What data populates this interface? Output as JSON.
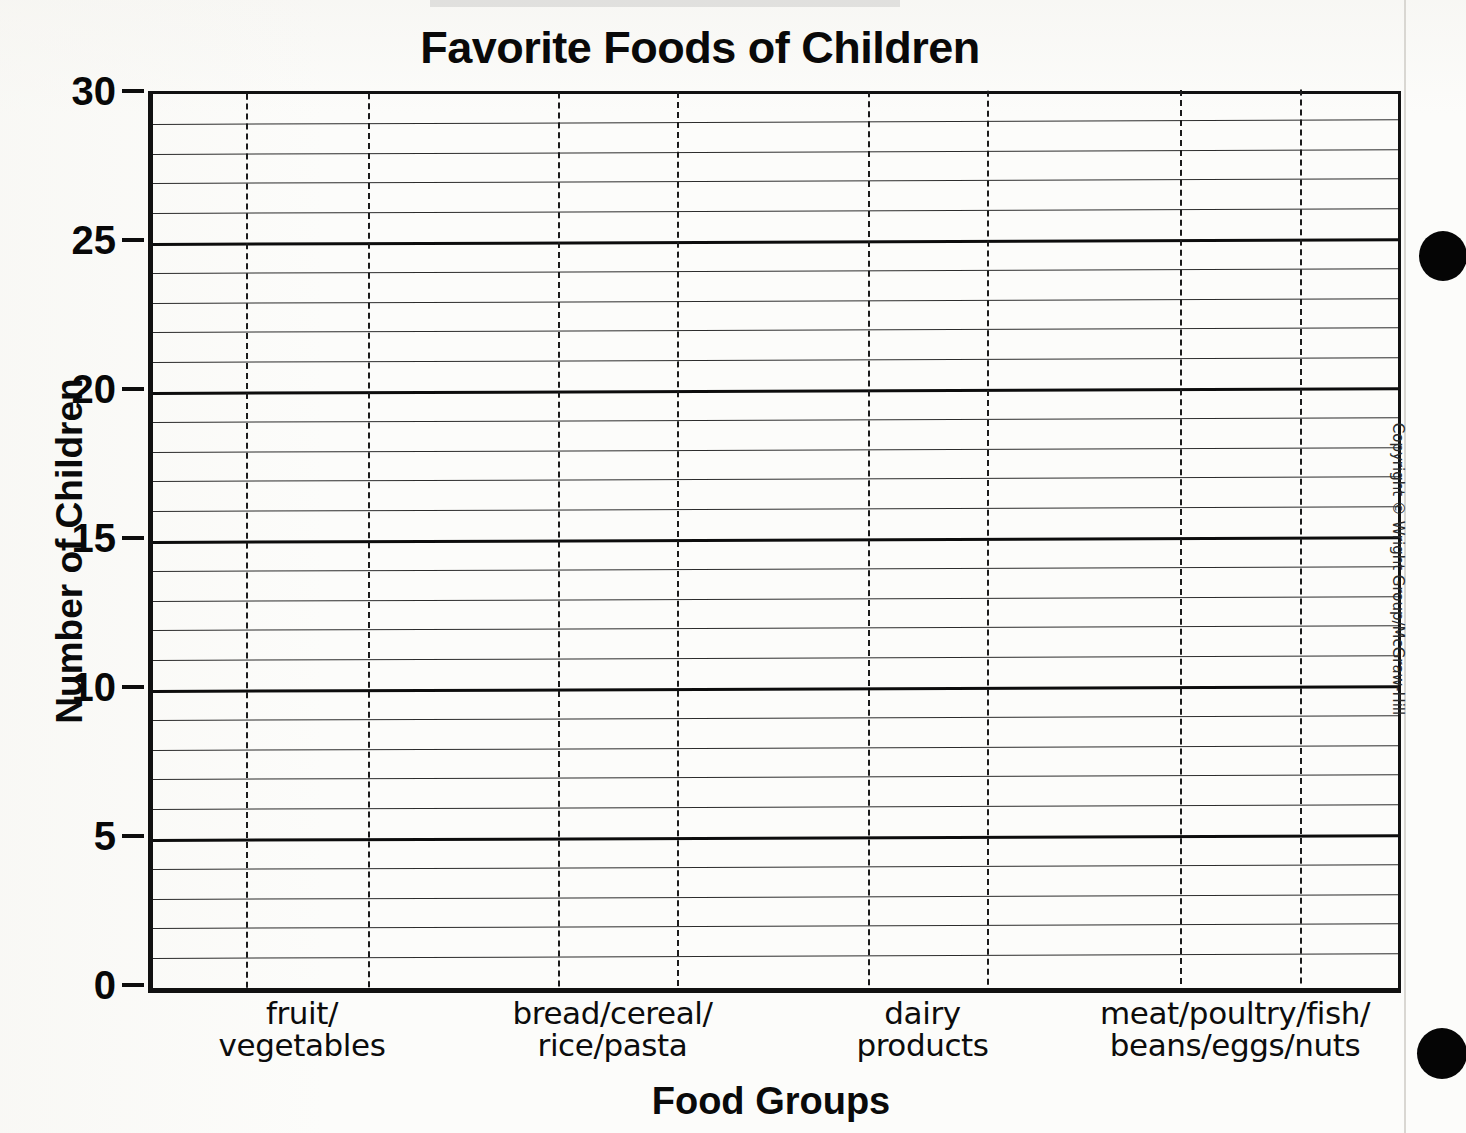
{
  "chart_data": {
    "type": "bar",
    "title": "Favorite Foods of Children",
    "xlabel": "Food Groups",
    "ylabel": "Number of Children",
    "categories": [
      "fruit/ vegetables",
      "bread/cereal/ rice/pasta",
      "dairy products",
      "meat/poultry/fish/ beans/eggs/nuts"
    ],
    "values": [
      null,
      null,
      null,
      null
    ],
    "ylim": [
      0,
      30
    ],
    "ytick_step": 5,
    "yticks": [
      "0",
      "5",
      "10",
      "15",
      "20",
      "25",
      "30"
    ],
    "minor_gridline_step": 1,
    "grid": "horizontal-major-and-minor, vertical-dashed-guides",
    "legend": "none",
    "note": "Blank worksheet grid: no bars are drawn; axes and gridlines only."
  },
  "header": {
    "title": "Favorite Foods of Children"
  },
  "axes": {
    "y": {
      "title": "Number of Children",
      "ticks": [
        {
          "value": 30,
          "label": "30"
        },
        {
          "value": 25,
          "label": "25"
        },
        {
          "value": 20,
          "label": "20"
        },
        {
          "value": 15,
          "label": "15"
        },
        {
          "value": 10,
          "label": "10"
        },
        {
          "value": 5,
          "label": "5"
        },
        {
          "value": 0,
          "label": "0"
        }
      ]
    },
    "x": {
      "title": "Food Groups",
      "categories": [
        {
          "line1": "fruit/",
          "line2": "vegetables"
        },
        {
          "line1": "bread/cereal/",
          "line2": "rice/pasta"
        },
        {
          "line1": "dairy",
          "line2": "products"
        },
        {
          "line1": "meat/poultry/fish/",
          "line2": "beans/eggs/nuts"
        }
      ]
    }
  },
  "footer": {
    "copyright": "Copyright © Wright Group/McGraw-Hill"
  },
  "colors": {
    "ink": "#0d0d0d",
    "gridline": "#2c2c2c",
    "paper": "#fcfcfa"
  }
}
